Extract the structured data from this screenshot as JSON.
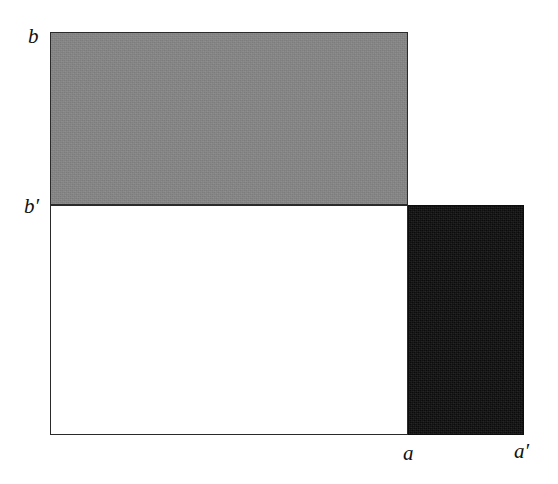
{
  "figure": {
    "background_color": "#ffffff",
    "width": 558,
    "height": 484
  },
  "shapes": {
    "gray_rectangle": {
      "name": "upper-gray-rectangle",
      "fill_color": "#878787",
      "stroke_color": "#2a2a2a",
      "x": 50,
      "y": 32,
      "width": 358,
      "height": 173
    },
    "white_rectangle": {
      "name": "lower-white-rectangle",
      "fill_color": "#ffffff",
      "stroke_color": "#2a2a2a",
      "x": 50,
      "y": 205,
      "width": 358,
      "height": 230
    },
    "black_rectangle": {
      "name": "right-black-rectangle",
      "fill_color": "#0d0d0d",
      "stroke_color": "#0d0d0d",
      "x": 408,
      "y": 205,
      "width": 116,
      "height": 230
    }
  },
  "labels": {
    "b": "b",
    "b_prime_base": "b",
    "b_prime_mark": "′",
    "a": "a",
    "a_prime_base": "a",
    "a_prime_mark": "′"
  },
  "chart_data": {
    "type": "diagram",
    "title": "",
    "axis_labels": {
      "vertical_top": "b",
      "vertical_mid": "b′",
      "horizontal_mid": "a",
      "horizontal_right": "a′"
    },
    "regions": [
      {
        "name": "gray",
        "fill": "#878787",
        "x": 50,
        "y": 32,
        "width": 358,
        "height": 173,
        "spans": "from b′ up to b, from origin to a"
      },
      {
        "name": "white",
        "fill": "#ffffff",
        "x": 50,
        "y": 205,
        "width": 358,
        "height": 230,
        "spans": "from baseline up to b′, from origin to a"
      },
      {
        "name": "black",
        "fill": "#0d0d0d",
        "x": 408,
        "y": 205,
        "width": 116,
        "height": 230,
        "spans": "from baseline up to b′, from a to a′"
      }
    ],
    "grid": false,
    "legend": "none"
  }
}
